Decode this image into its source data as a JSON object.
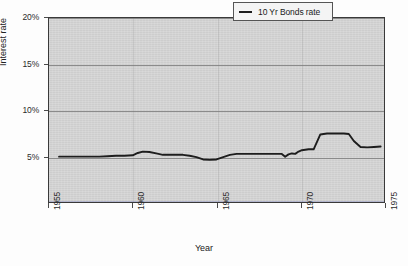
{
  "chart_data": {
    "type": "line",
    "title": "",
    "xlabel": "Year",
    "ylabel": "Interest rate",
    "xlim": [
      1955,
      1975
    ],
    "ylim": [
      0,
      20
    ],
    "grid": true,
    "legend_position": "top-right",
    "x_ticks": [
      1955,
      1960,
      1965,
      1970,
      1975
    ],
    "x_tick_labels": [
      "1955",
      "1960",
      "1965",
      "1970",
      "1975"
    ],
    "y_ticks": [
      5,
      10,
      15,
      20
    ],
    "y_tick_labels": [
      "5%",
      "10%",
      "15%",
      "20%"
    ],
    "series": [
      {
        "name": "10 Yr Bonds rate",
        "color": "#1d1d1d",
        "x": [
          1955.6,
          1956.0,
          1956.5,
          1957.0,
          1957.5,
          1958.0,
          1958.5,
          1959.0,
          1959.5,
          1960.0,
          1960.3,
          1960.6,
          1961.0,
          1961.4,
          1961.8,
          1962.2,
          1962.6,
          1963.0,
          1963.4,
          1963.8,
          1964.2,
          1964.6,
          1965.0,
          1965.4,
          1965.8,
          1966.2,
          1966.6,
          1967.0,
          1967.5,
          1968.0,
          1968.5,
          1968.9,
          1969.1,
          1969.3,
          1969.5,
          1969.7,
          1969.9,
          1970.1,
          1970.3,
          1970.5,
          1970.8,
          1971.2,
          1971.6,
          1972.0,
          1972.3,
          1972.6,
          1972.9,
          1973.2,
          1973.6,
          1974.0,
          1974.4,
          1974.8
        ],
        "y": [
          5.0,
          5.0,
          5.0,
          5.0,
          5.0,
          5.0,
          5.05,
          5.1,
          5.1,
          5.15,
          5.4,
          5.55,
          5.5,
          5.35,
          5.2,
          5.2,
          5.2,
          5.2,
          5.1,
          4.95,
          4.7,
          4.65,
          4.7,
          4.95,
          5.2,
          5.3,
          5.3,
          5.3,
          5.3,
          5.3,
          5.3,
          5.3,
          5.0,
          5.25,
          5.35,
          5.3,
          5.55,
          5.7,
          5.75,
          5.8,
          5.8,
          7.4,
          7.5,
          7.5,
          7.5,
          7.5,
          7.45,
          6.7,
          6.05,
          6.0,
          6.05,
          6.1
        ],
        "units": "percent"
      },
      {
        "name": "baseline",
        "color": "#4a55b0",
        "x": [
          1955.0,
          1975.0
        ],
        "y": [
          0.05,
          0.05
        ],
        "units": "percent"
      }
    ]
  },
  "legend": {
    "entries": [
      {
        "label": "10 Yr Bonds rate",
        "swatch": "line-swatch-icon"
      }
    ]
  },
  "axis": {
    "x_title": "Year",
    "y_title": "Interest rate"
  }
}
